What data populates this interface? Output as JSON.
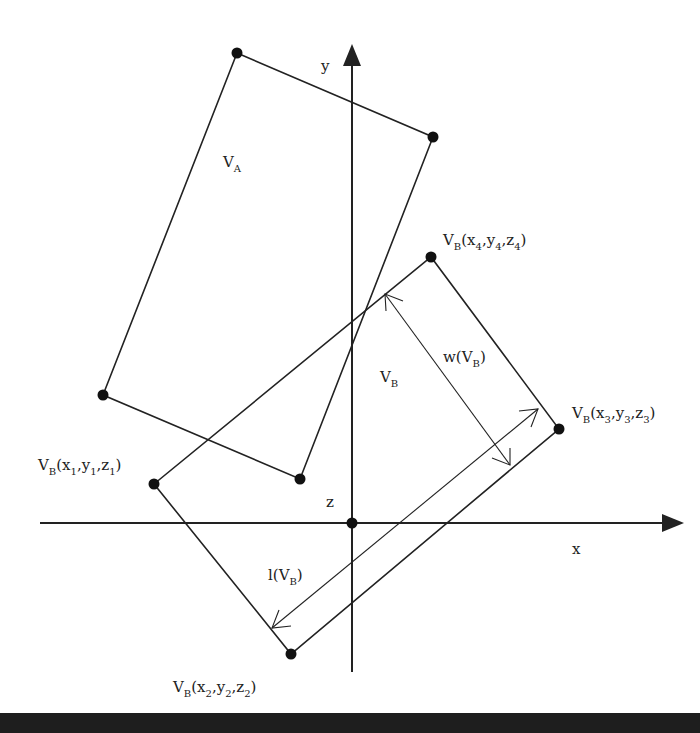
{
  "diagram": {
    "colors": {
      "line": "#222222",
      "background": "#ffffff",
      "bottom_bar": "#1e1e1e"
    },
    "axes": {
      "x_label": "x",
      "y_label": "y",
      "z_label": "z",
      "origin": [
        352,
        523
      ]
    },
    "rectangle_A": {
      "label_main": "V",
      "label_sub": "A",
      "vertices": [
        [
          237,
          53
        ],
        [
          433,
          137
        ],
        [
          300,
          479
        ],
        [
          103,
          395
        ]
      ]
    },
    "rectangle_B": {
      "label_main": "V",
      "label_sub": "B",
      "vertices": [
        [
          154,
          484
        ],
        [
          291,
          654
        ],
        [
          559,
          429
        ],
        [
          431,
          257
        ]
      ],
      "vertex_labels": [
        {
          "main": "V",
          "sub": "B",
          "open": "(x",
          "s1": "1",
          "m1": ",y",
          "s2": "1",
          "m2": ",z",
          "s3": "1",
          "close": ")"
        },
        {
          "main": "V",
          "sub": "B",
          "open": "(x",
          "s1": "2",
          "m1": ",y",
          "s2": "2",
          "m2": ",z",
          "s3": "2",
          "close": ")"
        },
        {
          "main": "V",
          "sub": "B",
          "open": "(x",
          "s1": "3",
          "m1": ",y",
          "s2": "3",
          "m2": ",z",
          "s3": "3",
          "close": ")"
        },
        {
          "main": "V",
          "sub": "B",
          "open": "(x",
          "s1": "4",
          "m1": ",y",
          "s2": "4",
          "m2": ",z",
          "s3": "4",
          "close": ")"
        }
      ]
    },
    "dimensions": {
      "width_label": {
        "pre": "w(V",
        "sub": "B",
        "post": ")"
      },
      "length_label": {
        "pre": "l(V",
        "sub": "B",
        "post": ")"
      }
    }
  }
}
